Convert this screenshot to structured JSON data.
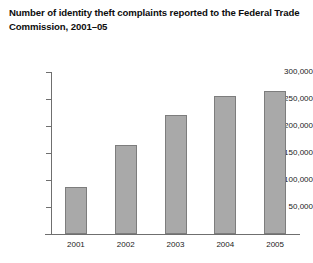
{
  "chart_data": {
    "type": "bar",
    "title": "Number of identity theft complaints reported to the Federal Trade Commission, 2001–05",
    "title_line1": "Number of identity theft complaints reported to the Federal",
    "title_line2": "Trade Commission, 2001–05",
    "xlabel": "",
    "ylabel": "",
    "categories": [
      "2001",
      "2002",
      "2003",
      "2004",
      "2005"
    ],
    "values": [
      87000,
      164000,
      220000,
      255000,
      265000
    ],
    "ylim": [
      0,
      300000
    ],
    "ytick_values": [
      50000,
      100000,
      150000,
      200000,
      250000,
      300000
    ],
    "ytick_labels": [
      "50,000",
      "100,000",
      "150,000",
      "200,000",
      "250,000",
      "300,000"
    ],
    "grid": false,
    "legend": null,
    "bar_color": "#a9a9a9",
    "bar_border_color": "#7d7d7d",
    "axis_color": "#6f6f6f",
    "background_color": "#ffffff",
    "text_color": "#1a1a1a"
  }
}
